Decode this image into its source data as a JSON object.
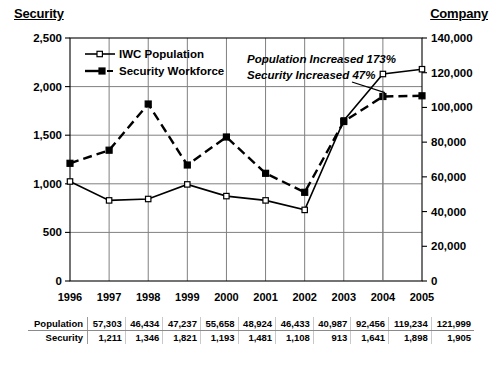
{
  "axis_titles": {
    "left": "Security",
    "right": "Company"
  },
  "chart_data": {
    "type": "line",
    "title": "",
    "xlabel": "",
    "ylabel": "Security",
    "y2label": "Company",
    "grid": true,
    "legend_position": "top-left",
    "categories": [
      "1996",
      "1997",
      "1998",
      "1999",
      "2000",
      "2001",
      "2002",
      "2003",
      "2004",
      "2005"
    ],
    "ylim": [
      0,
      2500
    ],
    "yticks": [
      "0",
      "500",
      "1,000",
      "1,500",
      "2,000",
      "2,500"
    ],
    "ytick_values": [
      0,
      500,
      1000,
      1500,
      2000,
      2500
    ],
    "y2lim": [
      0,
      140000
    ],
    "y2ticks": [
      "0",
      "20,000",
      "40,000",
      "60,000",
      "80,000",
      "100,000",
      "120,000",
      "140,000"
    ],
    "y2tick_values": [
      0,
      20000,
      40000,
      60000,
      80000,
      100000,
      120000,
      140000
    ],
    "series": [
      {
        "name": "IWC Population",
        "axis": "right",
        "marker": "open-square",
        "line": "solid",
        "values": [
          57303,
          46434,
          47237,
          55658,
          48924,
          46433,
          40987,
          92456,
          119234,
          121999
        ]
      },
      {
        "name": "Security Workforce",
        "axis": "left",
        "marker": "filled-square",
        "line": "dashed",
        "values": [
          1211,
          1346,
          1821,
          1193,
          1481,
          1108,
          913,
          1641,
          1898,
          1905
        ]
      }
    ],
    "annotations": [
      "Population Increased 173%",
      "Security Increased 47%"
    ],
    "table": {
      "rows": [
        {
          "label": "Population",
          "values": [
            "57,303",
            "46,434",
            "47,237",
            "55,658",
            "48,924",
            "46,433",
            "40,987",
            "92,456",
            "119,234",
            "121,999"
          ]
        },
        {
          "label": "Security",
          "values": [
            "1,211",
            "1,346",
            "1,821",
            "1,193",
            "1,481",
            "1,108",
            "913",
            "1,641",
            "1,898",
            "1,905"
          ]
        }
      ]
    }
  }
}
